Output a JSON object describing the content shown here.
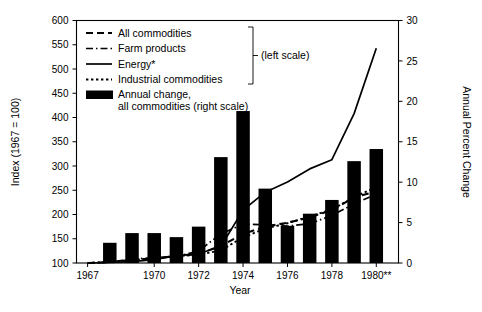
{
  "chart_data": {
    "type": "line",
    "title": "",
    "subtitle": "",
    "xlabel": "Year",
    "ylabel": "Index (1967 = 100)",
    "y2label": "Annual Percent Change",
    "xlim": [
      1966.5,
      1981.0
    ],
    "ylim": [
      100,
      600
    ],
    "y2lim": [
      0,
      30
    ],
    "grid": false,
    "legend_position": "upper-left-inside",
    "x_tick_labels": [
      "1967",
      "1970",
      "1972",
      "1974",
      "1976",
      "1978",
      "1980**"
    ],
    "x_tick_values": [
      1967,
      1970,
      1972,
      1974,
      1976,
      1978,
      1980
    ],
    "y_tick_labels": [
      "100",
      "150",
      "200",
      "250",
      "300",
      "350",
      "400",
      "450",
      "500",
      "550",
      "600"
    ],
    "y_tick_values": [
      100,
      150,
      200,
      250,
      300,
      350,
      400,
      450,
      500,
      550,
      600
    ],
    "y2_tick_labels": [
      "0",
      "5",
      "10",
      "15",
      "20",
      "25",
      "30"
    ],
    "y2_tick_values": [
      0,
      5,
      10,
      15,
      20,
      25,
      30
    ],
    "categories": [
      1967,
      1968,
      1969,
      1970,
      1971,
      1972,
      1973,
      1974,
      1975,
      1976,
      1977,
      1978,
      1979,
      1980
    ],
    "bars": {
      "name": "Annual change, all commodities (right scale)",
      "axis": "right",
      "units": "percent",
      "x": [
        1968,
        1969,
        1970,
        1971,
        1972,
        1973,
        1974,
        1975,
        1976,
        1977,
        1978,
        1979,
        1980
      ],
      "values": [
        2.5,
        3.7,
        3.7,
        3.2,
        4.5,
        13.1,
        18.8,
        9.2,
        4.6,
        6.1,
        7.8,
        12.6,
        14.1
      ]
    },
    "series": [
      {
        "name": "All commodities",
        "axis": "left",
        "style": "dashed",
        "x": [
          1967,
          1968,
          1969,
          1970,
          1971,
          1972,
          1973,
          1974,
          1975,
          1976,
          1977,
          1978,
          1979,
          1980
        ],
        "values": [
          100,
          102,
          106,
          110,
          114,
          119,
          135,
          160,
          175,
          183,
          194,
          209,
          235,
          248
        ]
      },
      {
        "name": "Farm products",
        "axis": "left",
        "style": "dash-dot",
        "x": [
          1967,
          1968,
          1969,
          1970,
          1971,
          1972,
          1973,
          1974,
          1975,
          1976,
          1977,
          1978,
          1979,
          1980
        ],
        "values": [
          100,
          102,
          108,
          111,
          113,
          125,
          160,
          180,
          179,
          176,
          181,
          198,
          222,
          242
        ]
      },
      {
        "name": "Energy*",
        "axis": "left",
        "style": "solid",
        "x": [
          1967,
          1968,
          1969,
          1970,
          1971,
          1972,
          1973,
          1974,
          1975,
          1976,
          1977,
          1978,
          1979,
          1980
        ],
        "values": [
          100,
          101,
          103,
          107,
          115,
          119,
          134,
          209,
          246,
          267,
          294,
          313,
          408,
          543
        ]
      },
      {
        "name": "Industrial commodities",
        "axis": "left",
        "style": "dotted",
        "x": [
          1967,
          1968,
          1969,
          1970,
          1971,
          1972,
          1973,
          1974,
          1975,
          1976,
          1977,
          1978,
          1979,
          1980
        ],
        "values": [
          100,
          102,
          106,
          110,
          114,
          117,
          126,
          153,
          171,
          182,
          196,
          210,
          236,
          256
        ]
      }
    ]
  },
  "legend": {
    "bracket_label": "(left scale)",
    "entries": [
      {
        "label": "All commodities",
        "style": "dashed"
      },
      {
        "label": "Farm products",
        "style": "dash-dot"
      },
      {
        "label": "Energy*",
        "style": "solid"
      },
      {
        "label": "Industrial commodities",
        "style": "dotted"
      },
      {
        "label_line1": "Annual change,",
        "label_line2": "all commodities (right scale)",
        "style": "swatch"
      }
    ]
  },
  "axes": {
    "left_title": "Index (1967 = 100)",
    "right_title": "Annual Percent Change",
    "bottom_title": "Year"
  }
}
